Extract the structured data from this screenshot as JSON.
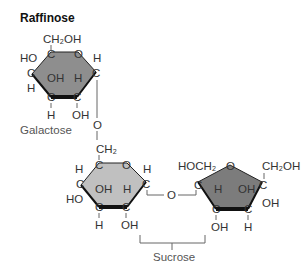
{
  "title": "Raffinose",
  "colors": {
    "galactose_ring": "#8e8e8e",
    "glucose_ring": "#c0c0c0",
    "fructose_ring": "#7c7c7c",
    "ring_edge": "#111111",
    "text": "#333333"
  },
  "galactose": {
    "name": "Galactose",
    "top_group": "CH₂OH",
    "c_label": "C",
    "o_label": "O",
    "left_upper": "HO",
    "left_lower": "H",
    "inner_left": "OH",
    "inner_right": "H",
    "bottom_left": "H",
    "bottom_right": "OH",
    "right_top": "H"
  },
  "glycosidic_1": "O",
  "glucose": {
    "top_group": "CH₂",
    "c_label": "C",
    "o_label": "O",
    "left_upper": "H",
    "left_lower": "HO",
    "inner_left": "OH",
    "inner_right": "H",
    "bottom_left": "H",
    "bottom_right": "OH",
    "right_top": "H"
  },
  "glycosidic_2": "O",
  "fructose": {
    "left_top": "HOCH₂",
    "right_top": "CH₂OH",
    "c_label": "C",
    "o_label": "O",
    "inner_left": "H",
    "inner_right": "OH",
    "bottom_left": "OH",
    "bottom_right": "H",
    "right_lower": "OH"
  },
  "sucrose_label": "Sucrose"
}
